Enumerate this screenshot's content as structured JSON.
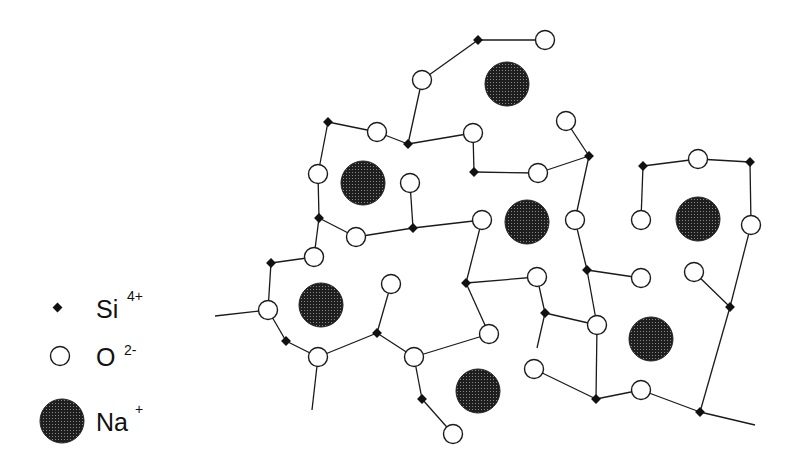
{
  "legend": {
    "items": [
      {
        "symbol": "Si",
        "charge": "4+",
        "marker": "small-black-diamond"
      },
      {
        "symbol": "O",
        "charge": "2-",
        "marker": "open-circle"
      },
      {
        "symbol": "Na",
        "charge": "+",
        "marker": "large-dotted-dark-circle"
      }
    ]
  },
  "colors": {
    "bond": "#1a1a1a",
    "si": "#111111",
    "o_fill": "#ffffff",
    "na": "#2a2a2a",
    "background": "#ffffff"
  },
  "structure": {
    "si": [
      [
        478,
        40
      ],
      [
        328,
        122
      ],
      [
        408,
        144
      ],
      [
        474,
        172
      ],
      [
        589,
        156
      ],
      [
        319,
        218
      ],
      [
        413,
        228
      ],
      [
        271,
        263
      ],
      [
        466,
        283
      ],
      [
        587,
        270
      ],
      [
        286,
        341
      ],
      [
        377,
        333
      ],
      [
        545,
        313
      ],
      [
        422,
        399
      ],
      [
        643,
        166
      ],
      [
        750,
        162
      ],
      [
        730,
        307
      ],
      [
        596,
        399
      ],
      [
        700,
        412
      ]
    ],
    "o": [
      [
        545,
        40
      ],
      [
        422,
        80
      ],
      [
        377,
        132
      ],
      [
        473,
        133
      ],
      [
        566,
        121
      ],
      [
        318,
        174
      ],
      [
        410,
        183
      ],
      [
        538,
        173
      ],
      [
        356,
        237
      ],
      [
        482,
        220
      ],
      [
        314,
        257
      ],
      [
        575,
        220
      ],
      [
        268,
        310
      ],
      [
        391,
        284
      ],
      [
        489,
        334
      ],
      [
        537,
        277
      ],
      [
        318,
        357
      ],
      [
        414,
        357
      ],
      [
        597,
        325
      ],
      [
        534,
        369
      ],
      [
        453,
        434
      ],
      [
        641,
        390
      ],
      [
        698,
        159
      ],
      [
        641,
        220
      ],
      [
        751,
        225
      ],
      [
        641,
        278
      ],
      [
        694,
        272
      ]
    ],
    "na": [
      [
        507,
        84
      ],
      [
        363,
        183
      ],
      [
        527,
        222
      ],
      [
        698,
        219
      ],
      [
        321,
        305
      ],
      [
        478,
        391
      ],
      [
        651,
        339
      ]
    ],
    "bonds": [
      [
        [
          478,
          40
        ],
        [
          545,
          40
        ]
      ],
      [
        [
          478,
          40
        ],
        [
          422,
          80
        ]
      ],
      [
        [
          422,
          80
        ],
        [
          408,
          144
        ]
      ],
      [
        [
          328,
          122
        ],
        [
          377,
          132
        ]
      ],
      [
        [
          377,
          132
        ],
        [
          408,
          144
        ]
      ],
      [
        [
          408,
          144
        ],
        [
          473,
          133
        ]
      ],
      [
        [
          473,
          133
        ],
        [
          474,
          172
        ]
      ],
      [
        [
          474,
          172
        ],
        [
          538,
          173
        ]
      ],
      [
        [
          538,
          173
        ],
        [
          589,
          156
        ]
      ],
      [
        [
          566,
          121
        ],
        [
          589,
          156
        ]
      ],
      [
        [
          589,
          156
        ],
        [
          575,
          220
        ]
      ],
      [
        [
          575,
          220
        ],
        [
          587,
          270
        ]
      ],
      [
        [
          328,
          122
        ],
        [
          318,
          174
        ]
      ],
      [
        [
          318,
          174
        ],
        [
          319,
          218
        ]
      ],
      [
        [
          319,
          218
        ],
        [
          356,
          237
        ]
      ],
      [
        [
          356,
          237
        ],
        [
          413,
          228
        ]
      ],
      [
        [
          410,
          183
        ],
        [
          413,
          228
        ]
      ],
      [
        [
          413,
          228
        ],
        [
          482,
          220
        ]
      ],
      [
        [
          319,
          218
        ],
        [
          314,
          257
        ]
      ],
      [
        [
          314,
          257
        ],
        [
          271,
          263
        ]
      ],
      [
        [
          271,
          263
        ],
        [
          268,
          310
        ]
      ],
      [
        [
          215,
          316
        ],
        [
          268,
          310
        ]
      ],
      [
        [
          268,
          310
        ],
        [
          286,
          341
        ]
      ],
      [
        [
          286,
          341
        ],
        [
          318,
          357
        ]
      ],
      [
        [
          318,
          357
        ],
        [
          312,
          410
        ]
      ],
      [
        [
          318,
          357
        ],
        [
          377,
          333
        ]
      ],
      [
        [
          377,
          333
        ],
        [
          391,
          284
        ]
      ],
      [
        [
          377,
          333
        ],
        [
          414,
          357
        ]
      ],
      [
        [
          414,
          357
        ],
        [
          489,
          334
        ]
      ],
      [
        [
          414,
          357
        ],
        [
          422,
          399
        ]
      ],
      [
        [
          422,
          399
        ],
        [
          453,
          434
        ]
      ],
      [
        [
          482,
          220
        ],
        [
          466,
          283
        ]
      ],
      [
        [
          466,
          283
        ],
        [
          489,
          334
        ]
      ],
      [
        [
          466,
          283
        ],
        [
          537,
          277
        ]
      ],
      [
        [
          537,
          277
        ],
        [
          545,
          313
        ]
      ],
      [
        [
          545,
          313
        ],
        [
          537,
          348
        ]
      ],
      [
        [
          545,
          313
        ],
        [
          597,
          325
        ]
      ],
      [
        [
          587,
          270
        ],
        [
          641,
          278
        ]
      ],
      [
        [
          587,
          270
        ],
        [
          597,
          325
        ]
      ],
      [
        [
          597,
          325
        ],
        [
          596,
          399
        ]
      ],
      [
        [
          534,
          369
        ],
        [
          596,
          399
        ]
      ],
      [
        [
          596,
          399
        ],
        [
          641,
          390
        ]
      ],
      [
        [
          641,
          390
        ],
        [
          700,
          412
        ]
      ],
      [
        [
          700,
          412
        ],
        [
          755,
          425
        ]
      ],
      [
        [
          700,
          412
        ],
        [
          730,
          307
        ]
      ],
      [
        [
          694,
          272
        ],
        [
          730,
          307
        ]
      ],
      [
        [
          730,
          307
        ],
        [
          751,
          225
        ]
      ],
      [
        [
          751,
          225
        ],
        [
          750,
          162
        ]
      ],
      [
        [
          750,
          162
        ],
        [
          698,
          159
        ]
      ],
      [
        [
          698,
          159
        ],
        [
          643,
          166
        ]
      ],
      [
        [
          643,
          166
        ],
        [
          641,
          220
        ]
      ]
    ]
  }
}
